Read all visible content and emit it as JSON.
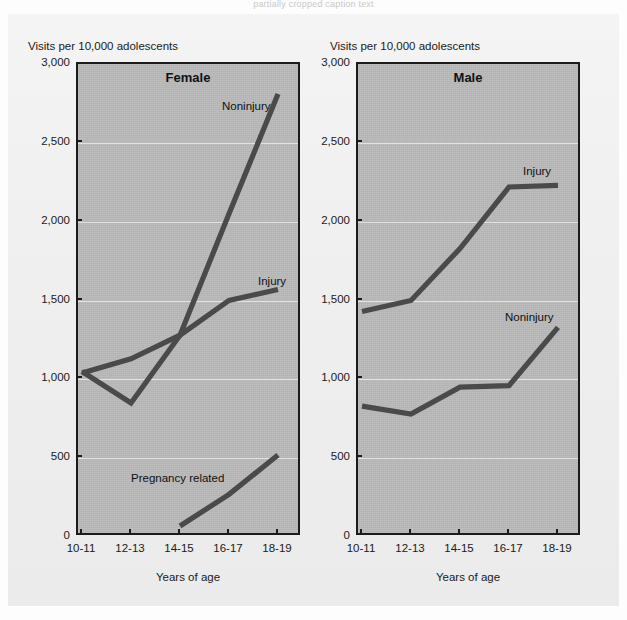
{
  "top_caption": "partially cropped caption text",
  "axis": {
    "y_title": "Visits per 10,000 adolescents",
    "x_title": "Years of age",
    "y_ticks": [
      "3,000",
      "2,500",
      "2,000",
      "1,500",
      "1,000",
      "500",
      "0"
    ],
    "x_ticks": [
      "10-11",
      "12-13",
      "14-15",
      "16-17",
      "18-19"
    ]
  },
  "panels": {
    "female": {
      "title": "Female",
      "labels": {
        "noninjury": "Noninjury",
        "injury": "Injury",
        "pregnancy": "Pregnancy related"
      }
    },
    "male": {
      "title": "Male",
      "labels": {
        "injury": "Injury",
        "noninjury": "Noninjury"
      }
    }
  },
  "colors": {
    "line": "#4a4a4a",
    "plot_background": "#b9b9b9",
    "axis": "#1b1b1b",
    "page_background": "#efefef"
  },
  "chart_data": [
    {
      "type": "line",
      "title": "Female",
      "xlabel": "Years of age",
      "ylabel": "Visits per 10,000 adolescents",
      "categories": [
        "10-11",
        "12-13",
        "14-15",
        "16-17",
        "18-19"
      ],
      "ylim": [
        0,
        3000
      ],
      "ytick_values": [
        0,
        500,
        1000,
        1500,
        2000,
        2500,
        3000
      ],
      "grid": true,
      "legend": "inline-annotations",
      "series": [
        {
          "name": "Noninjury",
          "values": [
            1050,
            850,
            1280,
            2050,
            2810
          ]
        },
        {
          "name": "Injury",
          "values": [
            1040,
            1130,
            1280,
            1500,
            1570
          ]
        },
        {
          "name": "Pregnancy related",
          "values": [
            null,
            null,
            70,
            270,
            520
          ]
        }
      ]
    },
    {
      "type": "line",
      "title": "Male",
      "xlabel": "Years of age",
      "ylabel": "Visits per 10,000 adolescents",
      "categories": [
        "10-11",
        "12-13",
        "14-15",
        "16-17",
        "18-19"
      ],
      "ylim": [
        0,
        3000
      ],
      "ytick_values": [
        0,
        500,
        1000,
        1500,
        2000,
        2500,
        3000
      ],
      "grid": true,
      "legend": "inline-annotations",
      "series": [
        {
          "name": "Injury",
          "values": [
            1430,
            1500,
            1830,
            2220,
            2230
          ]
        },
        {
          "name": "Noninjury",
          "values": [
            830,
            780,
            950,
            960,
            1330
          ]
        }
      ]
    }
  ]
}
